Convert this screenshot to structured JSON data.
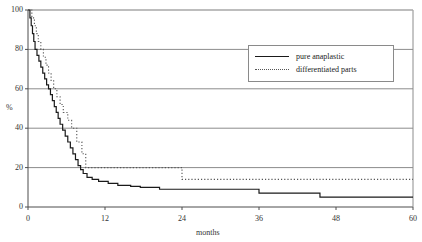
{
  "chart_data": {
    "type": "line",
    "title": "",
    "subtitle": "",
    "xlabel": "months",
    "ylabel": "%",
    "xlim": [
      0,
      60
    ],
    "ylim": [
      0,
      100
    ],
    "xticks": [
      0,
      12,
      24,
      36,
      48,
      60
    ],
    "yticks": [
      0,
      20,
      40,
      60,
      80,
      100
    ],
    "xtick_labels": [
      "0",
      "12",
      "24",
      "36",
      "48",
      "60"
    ],
    "ytick_labels": [
      "0",
      "20",
      "40",
      "60",
      "80",
      "100"
    ],
    "grid": "horizontal",
    "legend_position": "top-right-inside",
    "annotations": [],
    "series": [
      {
        "name": "pure anaplastic",
        "style": "solid",
        "color": "#1a1a1a",
        "points": [
          [
            0,
            100
          ],
          [
            0.3,
            96
          ],
          [
            0.5,
            92
          ],
          [
            0.7,
            88
          ],
          [
            0.9,
            84
          ],
          [
            1.1,
            80
          ],
          [
            1.4,
            77
          ],
          [
            1.7,
            74
          ],
          [
            2.0,
            71
          ],
          [
            2.3,
            68
          ],
          [
            2.6,
            65
          ],
          [
            2.9,
            62
          ],
          [
            3.2,
            60
          ],
          [
            3.5,
            57
          ],
          [
            3.8,
            54
          ],
          [
            4.1,
            51
          ],
          [
            4.4,
            48
          ],
          [
            4.7,
            45
          ],
          [
            5.0,
            42
          ],
          [
            5.4,
            39
          ],
          [
            5.8,
            36
          ],
          [
            6.2,
            33
          ],
          [
            6.6,
            30
          ],
          [
            7.0,
            27
          ],
          [
            7.4,
            24
          ],
          [
            7.8,
            21
          ],
          [
            8.2,
            19
          ],
          [
            8.6,
            17
          ],
          [
            9.2,
            15
          ],
          [
            10.0,
            14
          ],
          [
            11.0,
            13
          ],
          [
            12.5,
            12
          ],
          [
            14.0,
            11
          ],
          [
            16.0,
            10.5
          ],
          [
            17.5,
            10
          ],
          [
            20.5,
            9
          ],
          [
            36.0,
            7
          ],
          [
            45.5,
            5
          ],
          [
            60,
            5
          ]
        ]
      },
      {
        "name": "differentiated parts",
        "style": "dotted",
        "color": "#555555",
        "points": [
          [
            0,
            100
          ],
          [
            0.6,
            96
          ],
          [
            1.0,
            92
          ],
          [
            1.3,
            88
          ],
          [
            1.6,
            84
          ],
          [
            2.0,
            80
          ],
          [
            2.4,
            76
          ],
          [
            2.8,
            72
          ],
          [
            3.2,
            68
          ],
          [
            3.6,
            64
          ],
          [
            4.0,
            60
          ],
          [
            4.5,
            56
          ],
          [
            5.0,
            52
          ],
          [
            5.5,
            48
          ],
          [
            6.2,
            44
          ],
          [
            6.8,
            40
          ],
          [
            7.6,
            33
          ],
          [
            8.4,
            27
          ],
          [
            9.0,
            20
          ],
          [
            24.0,
            20
          ],
          [
            24.0,
            14
          ],
          [
            60,
            14
          ]
        ]
      }
    ]
  },
  "legend": {
    "items": [
      {
        "label": "pure anaplastic",
        "style": "solid"
      },
      {
        "label": "differentiated parts",
        "style": "dotted"
      }
    ]
  }
}
